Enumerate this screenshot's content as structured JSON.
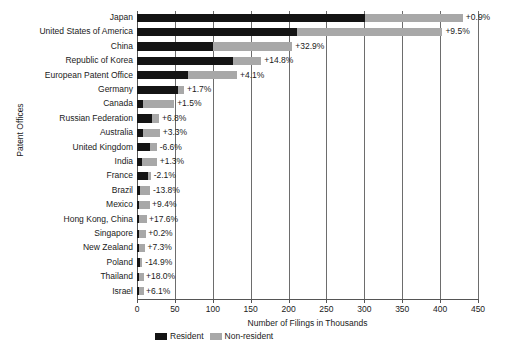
{
  "chart_data": {
    "type": "bar",
    "orientation": "horizontal",
    "title": "",
    "xlabel": "Number of Filings in Thousands",
    "ylabel": "Patent Offices",
    "xlim": [
      0,
      450
    ],
    "xticks": [
      0,
      50,
      100,
      150,
      200,
      250,
      300,
      350,
      400,
      450
    ],
    "grid": "vertical",
    "stacked": true,
    "legend_position": "bottom",
    "series": [
      {
        "name": "Resident",
        "color": "#141414"
      },
      {
        "name": "Non-resident",
        "color": "#a8a8a8"
      }
    ],
    "categories": [
      "Japan",
      "United States of America",
      "China",
      "Republic of Korea",
      "European Patent Office",
      "Germany",
      "Canada",
      "Russian Federation",
      "Australia",
      "United Kingdom",
      "India",
      "France",
      "Brazil",
      "Mexico",
      "Hong Kong, China",
      "Singapore",
      "New Zealand",
      "Poland",
      "Thailand",
      "Israel"
    ],
    "rows": [
      {
        "label": "Japan",
        "dark": 301,
        "light": 129,
        "growth": "+0.9%"
      },
      {
        "label": "United States of America",
        "dark": 211,
        "light": 192,
        "growth": "+9.5%"
      },
      {
        "label": "China",
        "dark": 100,
        "light": 105,
        "growth": "+32.9%"
      },
      {
        "label": "Republic of Korea",
        "dark": 127,
        "light": 37,
        "growth": "+14.8%"
      },
      {
        "label": "European Patent Office",
        "dark": 67,
        "light": 65,
        "growth": "+4.1%"
      },
      {
        "label": "Germany",
        "dark": 54,
        "light": 8,
        "growth": "+1.7%"
      },
      {
        "label": "Canada",
        "dark": 8,
        "light": 41,
        "growth": "+1.5%"
      },
      {
        "label": "Russian Federation",
        "dark": 20,
        "light": 9,
        "growth": "+6.8%"
      },
      {
        "label": "Australia",
        "dark": 8,
        "light": 22,
        "growth": "+3.3%"
      },
      {
        "label": "United Kingdom",
        "dark": 17,
        "light": 9,
        "growth": "-6.6%"
      },
      {
        "label": "India",
        "dark": 7,
        "light": 19,
        "growth": "+1.3%"
      },
      {
        "label": "France",
        "dark": 15,
        "light": 3,
        "growth": "-2.1%"
      },
      {
        "label": "Brazil",
        "dark": 4,
        "light": 13,
        "growth": "-13.8%"
      },
      {
        "label": "Mexico",
        "dark": 1,
        "light": 15,
        "growth": "+9.4%"
      },
      {
        "label": "Hong Kong, China",
        "dark": 1,
        "light": 11,
        "growth": "+17.6%"
      },
      {
        "label": "Singapore",
        "dark": 1,
        "light": 10,
        "growth": "+0.2%"
      },
      {
        "label": "New Zealand",
        "dark": 1,
        "light": 9,
        "growth": "+7.3%"
      },
      {
        "label": "Poland",
        "dark": 4,
        "light": 3,
        "growth": "-14.9%"
      },
      {
        "label": "Thailand",
        "dark": 1,
        "light": 7,
        "growth": "+18.0%"
      },
      {
        "label": "Israel",
        "dark": 1,
        "light": 7,
        "growth": "+6.1%"
      }
    ]
  }
}
